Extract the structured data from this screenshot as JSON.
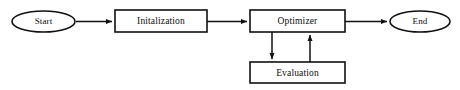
{
  "diagram": {
    "background_color": "#ffffff",
    "stroke_color": "#111111",
    "text_color": "#0d0d0d",
    "nodes": [
      {
        "id": "start",
        "label": "Start",
        "shape": "ellipse",
        "cx": 43.5,
        "cy": 21.5,
        "rx": 31.5,
        "ry": 10.5
      },
      {
        "id": "initalization",
        "label": "Initalization",
        "shape": "rectangle",
        "x": 115,
        "y": 10,
        "w": 92,
        "h": 22
      },
      {
        "id": "optimizer",
        "label": "Optimizer",
        "shape": "rectangle",
        "x": 250,
        "y": 10,
        "w": 95,
        "h": 22
      },
      {
        "id": "evaluation",
        "label": "Evaluation",
        "shape": "rectangle",
        "x": 250,
        "y": 62,
        "w": 95,
        "h": 21
      },
      {
        "id": "end",
        "label": "End",
        "shape": "ellipse",
        "cx": 420,
        "cy": 21.5,
        "rx": 30,
        "ry": 10.5
      }
    ],
    "edges": [
      {
        "id": "start-to-initalization",
        "from": "start",
        "to": "initalization",
        "direction": "right"
      },
      {
        "id": "initalization-to-optimizer",
        "from": "initalization",
        "to": "optimizer",
        "direction": "right"
      },
      {
        "id": "optimizer-to-end",
        "from": "optimizer",
        "to": "end",
        "direction": "right"
      },
      {
        "id": "optimizer-to-evaluation",
        "from": "optimizer",
        "to": "evaluation",
        "direction": "down"
      },
      {
        "id": "evaluation-to-optimizer",
        "from": "evaluation",
        "to": "optimizer",
        "direction": "up"
      }
    ]
  }
}
